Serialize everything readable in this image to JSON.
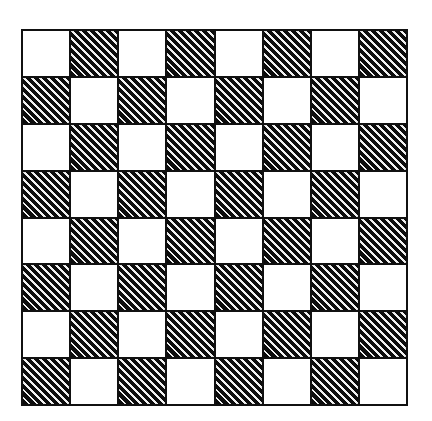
{
  "figure": {
    "kind": "checkerboard-diagram",
    "background_color": "#ffffff"
  },
  "board": {
    "rows": 8,
    "columns": 8,
    "square_count": 64,
    "light_square_count": 32,
    "dark_square_count": 32,
    "light_color": "#ffffff",
    "dark_color": "#0d0d0d",
    "hatch_color": "#f2f2f2",
    "hatch_angle_degrees": 45,
    "hatch_direction": "lower-left-to-upper-right",
    "border_color": "#111111",
    "border_width_px": 2,
    "top_left_square": "light",
    "bottom_left_square": "dark",
    "top_right_square": "dark",
    "bottom_right_square": "light",
    "geometry": {
      "left_px": 22,
      "top_px": 30,
      "width_px": 385,
      "height_px": 375,
      "square_width_px": 48,
      "square_height_px": 47
    },
    "grid": [
      [
        "light",
        "dark",
        "light",
        "dark",
        "light",
        "dark",
        "light",
        "dark"
      ],
      [
        "dark",
        "light",
        "dark",
        "light",
        "dark",
        "light",
        "dark",
        "light"
      ],
      [
        "light",
        "dark",
        "light",
        "dark",
        "light",
        "dark",
        "light",
        "dark"
      ],
      [
        "dark",
        "light",
        "dark",
        "light",
        "dark",
        "light",
        "dark",
        "light"
      ],
      [
        "light",
        "dark",
        "light",
        "dark",
        "light",
        "dark",
        "light",
        "dark"
      ],
      [
        "dark",
        "light",
        "dark",
        "light",
        "dark",
        "light",
        "dark",
        "light"
      ],
      [
        "light",
        "dark",
        "light",
        "dark",
        "light",
        "dark",
        "light",
        "dark"
      ],
      [
        "dark",
        "light",
        "dark",
        "light",
        "dark",
        "light",
        "dark",
        "light"
      ]
    ]
  }
}
